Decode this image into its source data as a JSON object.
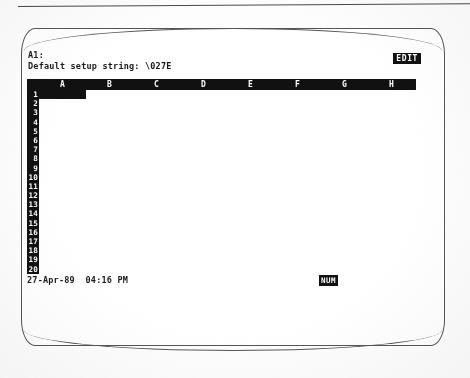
{
  "device": {
    "type": "crt-monitor-photograph",
    "screen_background": "#ffffff",
    "phosphor_color": "#111111",
    "reverse_video_bg": "#111111",
    "reverse_video_fg": "#ffffff"
  },
  "control_panel": {
    "cell_reference": "A1:",
    "edit_content": "Default setup string: \\027E",
    "mode_indicator": "EDIT"
  },
  "worksheet": {
    "column_headers": [
      "A",
      "B",
      "C",
      "D",
      "E",
      "F",
      "G",
      "H"
    ],
    "row_numbers": [
      "1",
      "2",
      "3",
      "4",
      "5",
      "6",
      "7",
      "8",
      "9",
      "10",
      "11",
      "12",
      "13",
      "14",
      "15",
      "16",
      "17",
      "18",
      "19",
      "20"
    ],
    "cursor_cell": "A1",
    "cells": []
  },
  "status_line": {
    "date": "27-Apr-89",
    "time": "04:16 PM",
    "datetime_display": "27-Apr-89  04:16 PM",
    "indicator": "NUM"
  }
}
